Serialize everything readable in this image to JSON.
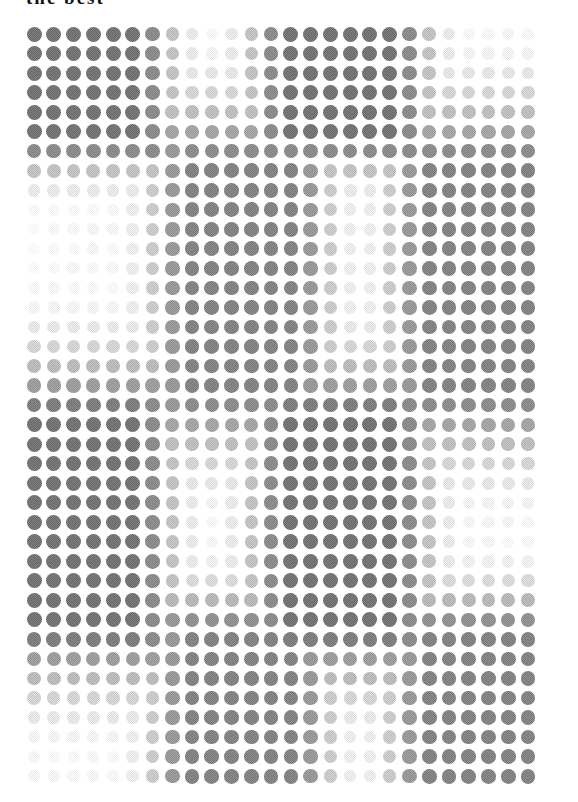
{
  "page": {
    "width": 578,
    "height": 802,
    "background": "#ffffff",
    "title_clipped": "the best",
    "title_note": "title is cropped at top edge; only letter descenders are visible"
  },
  "colors": {
    "dot_max": "#7a7a7a",
    "dot_mid": "#b4b4b4",
    "dot_min": "#f4f4f4",
    "background": "#ffffff",
    "title": "#111111"
  },
  "chart_data": {
    "type": "heatmap",
    "title": "",
    "subtitle": "",
    "xlabel": "",
    "ylabel": "",
    "grid": false,
    "legend": "none",
    "marker": "circle",
    "n_cols": 26,
    "n_rows": 39,
    "x_origin_px": 34,
    "y_origin_px": 34,
    "col_step_px": 19.76,
    "row_step_px": 19.53,
    "dot_max_diameter_px": 15,
    "value_range": [
      0,
      1
    ],
    "color_scale": [
      "#ffffff",
      "#7a7a7a"
    ],
    "clusters": [
      {
        "name": "cluster-1",
        "col_start": 0,
        "col_end": 5,
        "row_start": 0,
        "row_end": 5,
        "peak": 1.0
      },
      {
        "name": "cluster-2",
        "col_start": 13,
        "col_end": 18,
        "row_start": 0,
        "row_end": 5,
        "peak": 1.0
      },
      {
        "name": "cluster-3",
        "col_start": 8,
        "col_end": 13,
        "row_start": 7,
        "row_end": 18,
        "peak": 0.9
      },
      {
        "name": "cluster-4",
        "col_start": 20,
        "col_end": 25,
        "row_start": 7,
        "row_end": 18,
        "peak": 0.9
      },
      {
        "name": "cluster-5",
        "col_start": 0,
        "col_end": 5,
        "row_start": 20,
        "row_end": 30,
        "peak": 1.0
      },
      {
        "name": "cluster-6",
        "col_start": 13,
        "col_end": 18,
        "row_start": 20,
        "row_end": 30,
        "peak": 1.0
      },
      {
        "name": "cluster-7",
        "col_start": 8,
        "col_end": 13,
        "row_start": 31,
        "row_end": 38,
        "peak": 0.9
      },
      {
        "name": "cluster-8",
        "col_start": 20,
        "col_end": 25,
        "row_start": 31,
        "row_end": 38,
        "peak": 0.9
      }
    ],
    "noise_floor": 0.06,
    "noise_amplitude": 0.1
  }
}
